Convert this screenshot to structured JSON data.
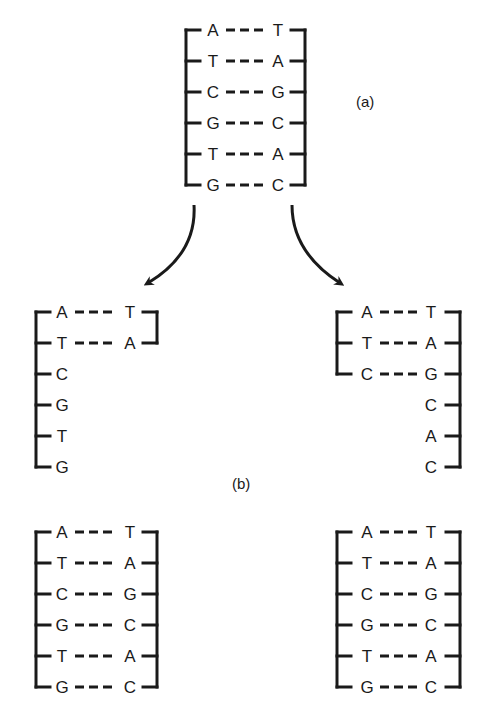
{
  "figure": {
    "labels": {
      "a": "(a)",
      "b": "(b)"
    },
    "parent": {
      "name": "parent-double-helix",
      "left_strand": [
        "A",
        "T",
        "C",
        "G",
        "T",
        "G"
      ],
      "right_strand": [
        "T",
        "A",
        "G",
        "C",
        "A",
        "C"
      ]
    },
    "replicating_left": {
      "name": "replicating-fork-left",
      "left_strand": [
        "A",
        "T",
        "C",
        "G",
        "T",
        "G"
      ],
      "right_strand": [
        "T",
        "A"
      ],
      "paired_rows": 2
    },
    "replicating_right": {
      "name": "replicating-fork-right",
      "left_strand": [
        "A",
        "T",
        "C"
      ],
      "right_strand": [
        "T",
        "A",
        "G",
        "C",
        "A",
        "C"
      ],
      "paired_rows": 3
    },
    "daughter_left": {
      "name": "daughter-helix-left",
      "left_strand": [
        "A",
        "T",
        "C",
        "G",
        "T",
        "G"
      ],
      "right_strand": [
        "T",
        "A",
        "G",
        "C",
        "A",
        "C"
      ]
    },
    "daughter_right": {
      "name": "daughter-helix-right",
      "left_strand": [
        "A",
        "T",
        "C",
        "G",
        "T",
        "G"
      ],
      "right_strand": [
        "T",
        "A",
        "G",
        "C",
        "A",
        "C"
      ]
    },
    "pair_bond": "- - -",
    "arrows": [
      "arrow-to-left-fork",
      "arrow-to-right-fork"
    ]
  }
}
